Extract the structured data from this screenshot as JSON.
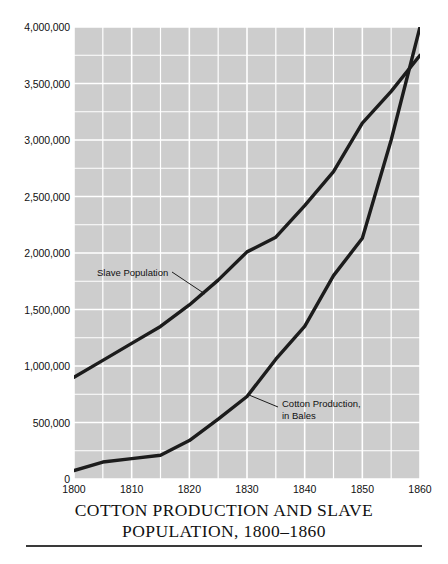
{
  "chart_data": {
    "type": "line",
    "title_line_1": "COTTON PRODUCTION AND SLAVE",
    "title_line_2": "POPULATION, 1800–1860",
    "xlabel": "",
    "ylabel": "",
    "xlim": [
      1800,
      1860
    ],
    "ylim": [
      0,
      4000000
    ],
    "grid": true,
    "grid_color": "#ffffff",
    "plot_background": "#cdcdcd",
    "line_color": "#1c1c1c",
    "legend_position": "inline-annotations",
    "x_ticks": [
      "1800",
      "1810",
      "1820",
      "1830",
      "1840",
      "1850",
      "1860"
    ],
    "x_tick_values": [
      1800,
      1810,
      1820,
      1830,
      1840,
      1850,
      1860
    ],
    "y_ticks": [
      "0",
      "500,000",
      "1,000,000",
      "1,500,000",
      "2,000,000",
      "2,500,000",
      "3,000,000",
      "3,500,000",
      "4,000,000"
    ],
    "y_tick_values": [
      0,
      500000,
      1000000,
      1500000,
      2000000,
      2500000,
      3000000,
      3500000,
      4000000
    ],
    "x_minor_step": 5,
    "y_minor_step": 250000,
    "series": [
      {
        "name": "Slave Population",
        "annotation_label": "Slave Population",
        "x": [
          1800,
          1805,
          1810,
          1815,
          1820,
          1825,
          1830,
          1835,
          1840,
          1845,
          1850,
          1855,
          1860
        ],
        "values": [
          900000,
          1050000,
          1200000,
          1350000,
          1540000,
          1760000,
          2010000,
          2140000,
          2420000,
          2720000,
          3150000,
          3430000,
          3750000
        ]
      },
      {
        "name": "Cotton Production, in Bales",
        "annotation_label": "Cotton Production,\nin Bales",
        "x": [
          1800,
          1805,
          1810,
          1815,
          1820,
          1825,
          1830,
          1835,
          1840,
          1845,
          1850,
          1855,
          1860
        ],
        "values": [
          75000,
          150000,
          180000,
          210000,
          340000,
          530000,
          730000,
          1060000,
          1350000,
          1800000,
          2130000,
          3000000,
          4000000
        ]
      }
    ]
  },
  "annotations": {
    "slave_population": "Slave Population",
    "cotton_production": "Cotton Production,\nin Bales"
  },
  "header": {
    "corner_note": ""
  }
}
